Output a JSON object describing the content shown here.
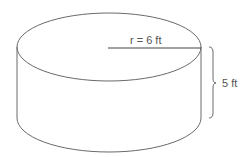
{
  "figure": {
    "shape": "cylinder",
    "radius_label": "r = 6 ft",
    "height_label": "5 ft",
    "stroke_color": "#6a6a6a",
    "text_color": "#555555"
  }
}
